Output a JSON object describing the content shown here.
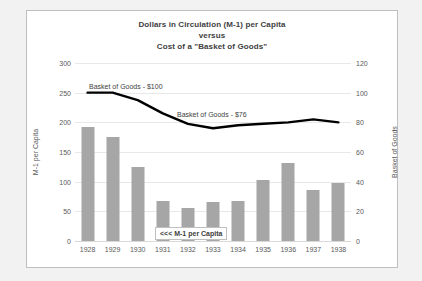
{
  "chart_data": {
    "type": "bar",
    "title": "Dollars in Circulation (M-1) per Capita\nversus\nCost of a \"Basket of Goods\"",
    "title_lines": [
      "Dollars in Circulation (M-1) per Capita",
      "versus",
      "Cost of a \"Basket of Goods\""
    ],
    "categories": [
      "1928",
      "1929",
      "1930",
      "1931",
      "1932",
      "1933",
      "1934",
      "1935",
      "1936",
      "1937",
      "1938"
    ],
    "xlabel": "",
    "ylabel": "M-1 per Capita",
    "y2label": "Basket of Goods",
    "ylim": [
      0,
      300
    ],
    "y2lim": [
      0,
      120
    ],
    "yticks": [
      0,
      50,
      100,
      150,
      200,
      250,
      300
    ],
    "y2ticks": [
      0,
      20,
      40,
      60,
      80,
      100,
      120
    ],
    "grid": true,
    "legend": "none",
    "series": [
      {
        "name": "M-1 per Capita",
        "type": "bar",
        "axis": "left",
        "color": "#a6a6a6",
        "values": [
          192,
          176,
          124,
          68,
          55,
          65,
          68,
          103,
          132,
          86,
          97
        ]
      },
      {
        "name": "Basket of Goods",
        "type": "line",
        "axis": "right",
        "color": "#000000",
        "values": [
          100,
          100,
          95,
          86,
          79,
          76,
          78,
          79,
          80,
          82,
          80
        ]
      }
    ],
    "annotations": [
      {
        "text": "Basket of Goods - $100",
        "name": "annotation-basket-100"
      },
      {
        "text": "Basket of Goods - $76",
        "name": "annotation-basket-76"
      },
      {
        "text": "<<< M-1 per Capita",
        "name": "annotation-m1-per-capita"
      }
    ]
  },
  "axis": {
    "left_title": "M-1 per Capita",
    "right_title": "Basket of Goods",
    "left_ticks": [
      "300",
      "250",
      "200",
      "150",
      "100",
      "50",
      "0"
    ],
    "right_ticks": [
      "120",
      "100",
      "80",
      "60",
      "40",
      "20",
      "0"
    ]
  },
  "title": {
    "line1": "Dollars in Circulation (M-1) per Capita",
    "line2": "versus",
    "line3": "Cost of a \"Basket of Goods\""
  },
  "annotations": {
    "basket_100": "Basket of Goods - $100",
    "basket_76": "Basket of Goods - $76",
    "m1_label": "<<< M-1 per Capita"
  },
  "colors": {
    "bar": "#a6a6a6",
    "line": "#000000",
    "grid": "#e8e8e8",
    "text": "#595959",
    "frame": "#bfbfbf",
    "page_background": "#f2f2f2"
  }
}
